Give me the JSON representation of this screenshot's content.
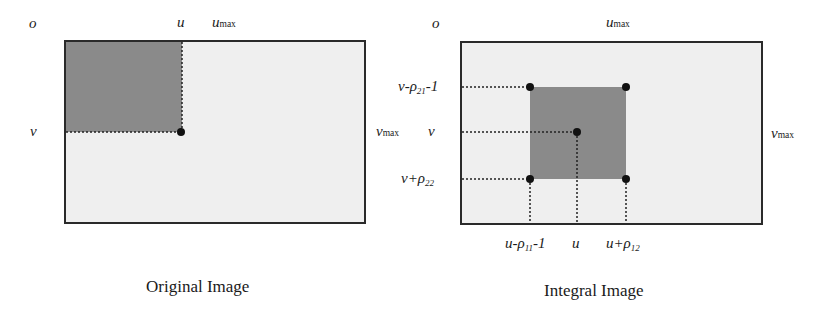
{
  "colors": {
    "background": "#ffffff",
    "image_fill": "#efefef",
    "region_fill": "#8a8a8a",
    "border": "#2a2a2a",
    "dot": "#111111"
  },
  "left_panel": {
    "caption": "Original Image",
    "labels": {
      "origin": "o",
      "u": "u",
      "umax_base": "u",
      "umax_sub": "max",
      "v": "v",
      "vmax_base": "v",
      "vmax_sub": "max"
    }
  },
  "right_panel": {
    "caption": "Integral Image",
    "labels": {
      "origin": "o",
      "umax_base": "u",
      "umax_sub": "max",
      "vmax_base": "v",
      "vmax_sub": "max",
      "v_top_pre": "v-ρ",
      "v_top_sub": "21",
      "v_top_post": "-1",
      "v_mid": "v",
      "v_bot_pre": "v+ρ",
      "v_bot_sub": "22",
      "u_left_pre": "u-ρ",
      "u_left_sub": "11",
      "u_left_post": "-1",
      "u_mid": "u",
      "u_right_pre": "u+ρ",
      "u_right_sub": "12"
    }
  }
}
